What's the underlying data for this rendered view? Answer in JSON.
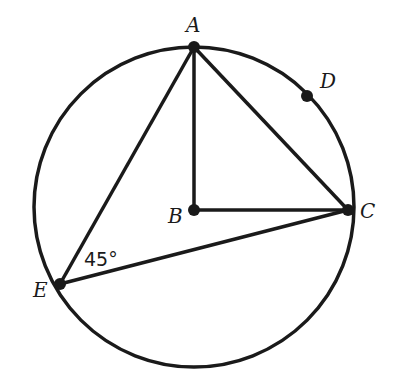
{
  "diagram": {
    "type": "circle-geometry",
    "points": {
      "A": {
        "label": "A",
        "x": 194,
        "y": 47
      },
      "B": {
        "label": "B",
        "x": 194,
        "y": 210
      },
      "C": {
        "label": "C",
        "x": 348,
        "y": 210
      },
      "D": {
        "label": "D",
        "x": 307,
        "y": 96
      },
      "E": {
        "label": "E",
        "x": 60,
        "y": 284
      }
    },
    "circle": {
      "center": "B",
      "radius": 160
    },
    "segments": [
      "AB",
      "BC",
      "AC",
      "AE",
      "EC"
    ],
    "angle_annotation": {
      "at": "E",
      "text": "45°"
    },
    "stroke_color": "#1a1a1a"
  }
}
